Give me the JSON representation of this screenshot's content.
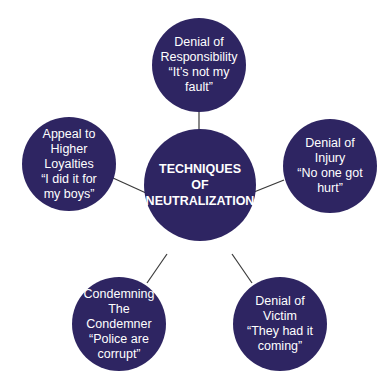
{
  "diagram": {
    "center": {
      "lines": [
        "TECHNIQUES",
        "OF",
        "NEUTRALIZATION"
      ]
    },
    "nodes": [
      {
        "id": "denial-of-responsibility",
        "lines": [
          "Denial of",
          "Responsibility",
          "“It’s not my",
          "fault”"
        ]
      },
      {
        "id": "denial-of-injury",
        "lines": [
          "Denial of",
          "Injury",
          "“No one got",
          "hurt”"
        ]
      },
      {
        "id": "denial-of-victim",
        "lines": [
          "Denial of",
          "Victim",
          "“They had it",
          "coming”"
        ]
      },
      {
        "id": "condemning-the-condemner",
        "lines": [
          "Condemning",
          "The",
          "Condemner",
          "“Police are",
          "corrupt”"
        ]
      },
      {
        "id": "appeal-to-higher-loyalties",
        "lines": [
          "Appeal to",
          "Higher",
          "Loyalties",
          "“I did it for",
          "my boys”"
        ]
      }
    ],
    "colors": {
      "node_fill": "#2e2562",
      "text": "#ffffff",
      "connector": "#3a3a3a",
      "background": "#ffffff"
    }
  }
}
